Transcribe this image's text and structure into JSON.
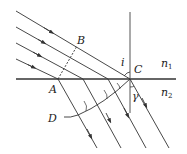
{
  "diagram": {
    "labels": {
      "A": "A",
      "B": "B",
      "C": "C",
      "D": "D",
      "incident_angle": "i",
      "refraction_angle": "γ",
      "medium1": "n",
      "medium1_sub": "1",
      "medium2": "n",
      "medium2_sub": "2"
    },
    "colors": {
      "line": "#333333",
      "background": "#ffffff"
    },
    "incident_ray_count": 4,
    "refracted_ray_count": 4
  }
}
